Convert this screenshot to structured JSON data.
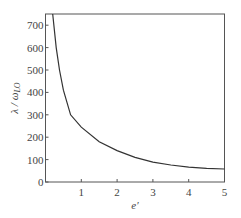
{
  "chart_data": {
    "type": "line",
    "title": "",
    "xlabel": "e′",
    "ylabel": "λ / ω_LO",
    "xlim": [
      0,
      5
    ],
    "ylim": [
      0,
      750
    ],
    "grid": false,
    "legend": null,
    "x_ticks": [
      1,
      2,
      3,
      4,
      5
    ],
    "y_ticks": [
      0,
      100,
      200,
      300,
      400,
      500,
      600,
      700
    ],
    "series": [
      {
        "name": "λ/ω_LO vs e′",
        "color": "#333333",
        "x": [
          0.2,
          0.3,
          0.39,
          0.5,
          0.7,
          1.0,
          1.5,
          2.0,
          2.5,
          3.0,
          3.5,
          4.0,
          4.5,
          5.0
        ],
        "y": [
          750,
          600,
          500,
          410,
          300,
          245,
          180,
          140,
          110,
          89,
          76,
          66,
          61,
          58
        ]
      }
    ]
  },
  "labels": {
    "xlabel": "e′",
    "ylabel_main": "λ / ω",
    "ylabel_sub": "LO"
  }
}
